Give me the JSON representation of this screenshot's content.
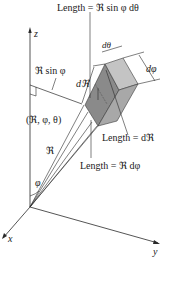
{
  "figure": {
    "labels": {
      "length_top": "Length = ℜ sin φ dθ",
      "z_axis": "z",
      "x_axis": "x",
      "y_axis": "y",
      "r_sin_phi": "ℜ sin φ",
      "d_theta": "dθ",
      "d_phi": "dφ",
      "d_r": "dℜ",
      "point": "(ℜ, φ, θ)",
      "length_dr": "Length = dℜ",
      "r": "ℜ",
      "length_rdphi": "Length = ℜ dφ",
      "phi": "φ"
    },
    "colors": {
      "line": "#2a2a2a",
      "box_dark": "#8a8a8a",
      "box_mid": "#a8a8a8",
      "box_light": "#c4c4c4",
      "background": "#ffffff"
    }
  }
}
